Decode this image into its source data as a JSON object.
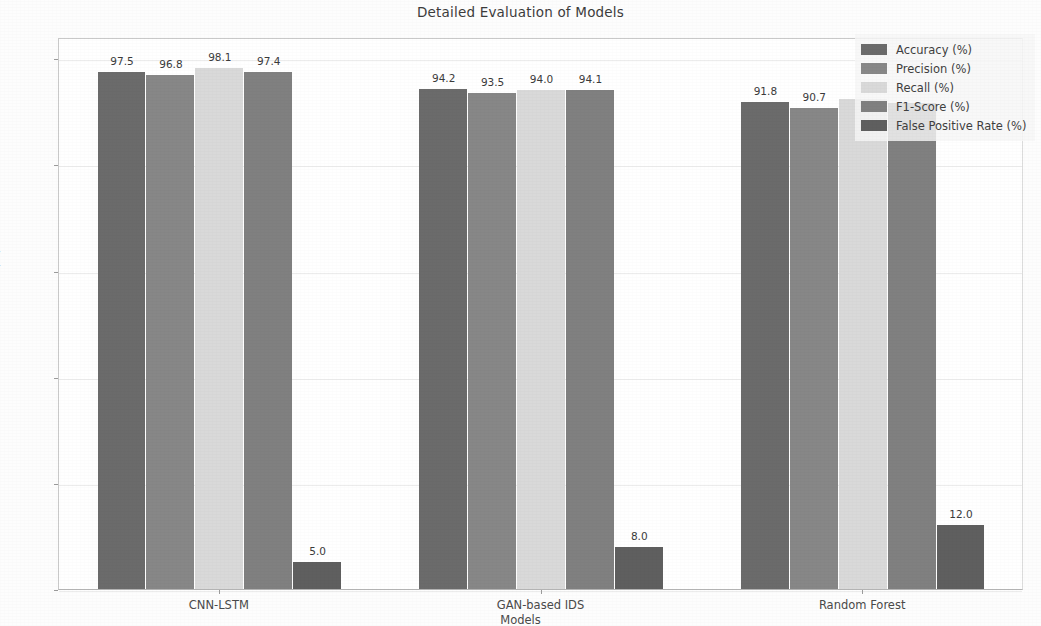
{
  "chart_data": {
    "type": "bar",
    "title": "Detailed Evaluation of Models",
    "xlabel": "Models",
    "ylabel": "Metrics (%)",
    "categories": [
      "CNN-LSTM",
      "GAN-based IDS",
      "Random Forest"
    ],
    "series": [
      {
        "name": "Accuracy (%)",
        "values": [
          97.5,
          94.2,
          91.8
        ],
        "color": "#6b6b6b"
      },
      {
        "name": "Precision (%)",
        "values": [
          96.8,
          93.5,
          90.7
        ],
        "color": "#878787"
      },
      {
        "name": "Recall (%)",
        "values": [
          98.1,
          94.0,
          92.3
        ],
        "color": "#d9d9d9"
      },
      {
        "name": "F1-Score (%)",
        "values": [
          97.4,
          94.1,
          91.5
        ],
        "color": "#808080"
      },
      {
        "name": "False Positive Rate (%)",
        "values": [
          5.0,
          8.0,
          12.0
        ],
        "color": "#5f5f5f"
      }
    ],
    "value_labels": [
      [
        "97.5",
        "96.8",
        "98.1",
        "97.4",
        "5.0"
      ],
      [
        "94.2",
        "93.5",
        "94.0",
        "94.1",
        "8.0"
      ],
      [
        "91.8",
        "90.7",
        "",
        "",
        "12.0"
      ]
    ],
    "ylim": [
      0,
      104
    ],
    "yticks": [
      0,
      20,
      40,
      60,
      80,
      100
    ],
    "ytick_labels": [
      "0",
      "20",
      "40",
      "60",
      "80",
      "100"
    ],
    "grid": true,
    "legend_position": "upper right"
  }
}
